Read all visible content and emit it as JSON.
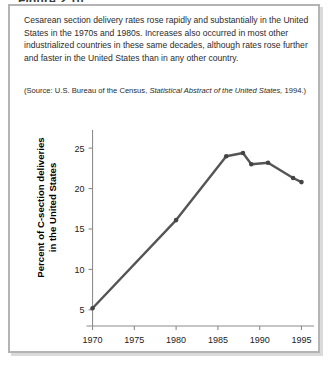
{
  "figure": {
    "title": "Figure 2.10",
    "caption": "Cesarean section delivery rates rose rapidly and substantially in the United States in the 1970s and 1980s. Increases also occurred in most other industrialized countries in these same decades, although rates rose further and faster in the United States than in any other country.",
    "source_prefix": "(Source:",
    "source_text": " U.S. Bureau of the Census, ",
    "source_italic_work": "Statistical Abstract of the United States,",
    "source_suffix": " 1994.)"
  },
  "chart_data": {
    "type": "line",
    "title": "",
    "xlabel": "",
    "ylabel": "Percent of C-section deliveries\nin the United States",
    "xlim": [
      1968.5,
      1996.5
    ],
    "ylim": [
      3.0,
      26.5
    ],
    "xticks": [
      1970,
      1975,
      1980,
      1985,
      1990,
      1995
    ],
    "yticks": [
      5,
      10,
      15,
      20,
      25
    ],
    "xtick_labels": [
      "1970",
      "1975",
      "1980",
      "1985",
      "1990",
      "1995"
    ],
    "ytick_labels": [
      "5",
      "10",
      "15",
      "20",
      "25"
    ],
    "grid": false,
    "legend": "none",
    "line_color": "#555555",
    "marker_color": "#444444",
    "axis_color": "#8c8c8c",
    "series": [
      {
        "name": "C-section delivery rate",
        "x": [
          1970,
          1980,
          1986,
          1988,
          1989,
          1991,
          1994,
          1995
        ],
        "y": [
          5.2,
          16.1,
          24.0,
          24.4,
          23.0,
          23.2,
          21.3,
          20.8
        ]
      }
    ]
  }
}
